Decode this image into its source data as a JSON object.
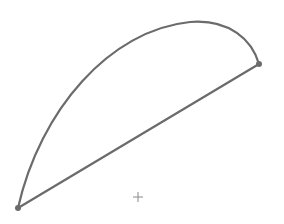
{
  "diagram": {
    "type": "arc-with-chord",
    "colors": {
      "background": "#ffffff",
      "stroke": "#6b6b6b",
      "marker": "#8a8a8a"
    },
    "points": {
      "start": {
        "x": 18,
        "y": 208
      },
      "end": {
        "x": 259,
        "y": 64
      },
      "center_marker": {
        "x": 138,
        "y": 197,
        "glyph": "+"
      }
    },
    "arc": {
      "description": "curved arc bulging up-left from start to end"
    },
    "chord": {
      "description": "straight line from start to end"
    }
  }
}
